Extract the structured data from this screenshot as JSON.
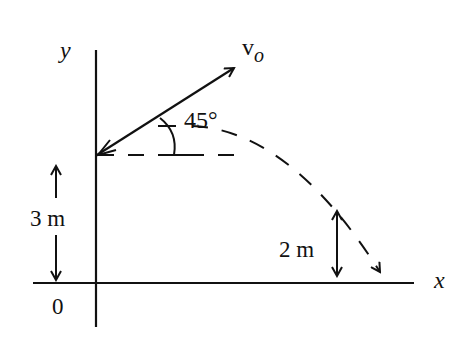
{
  "diagram": {
    "axes": {
      "x_label": "x",
      "y_label": "y",
      "origin_label": "0"
    },
    "velocity": {
      "label_main": "v",
      "label_sub": "o"
    },
    "angle": {
      "label": "45°"
    },
    "heights": {
      "launch_height": "3 m",
      "landing_height": "2 m"
    },
    "colors": {
      "stroke": "#111111",
      "background": "#ffffff"
    }
  }
}
